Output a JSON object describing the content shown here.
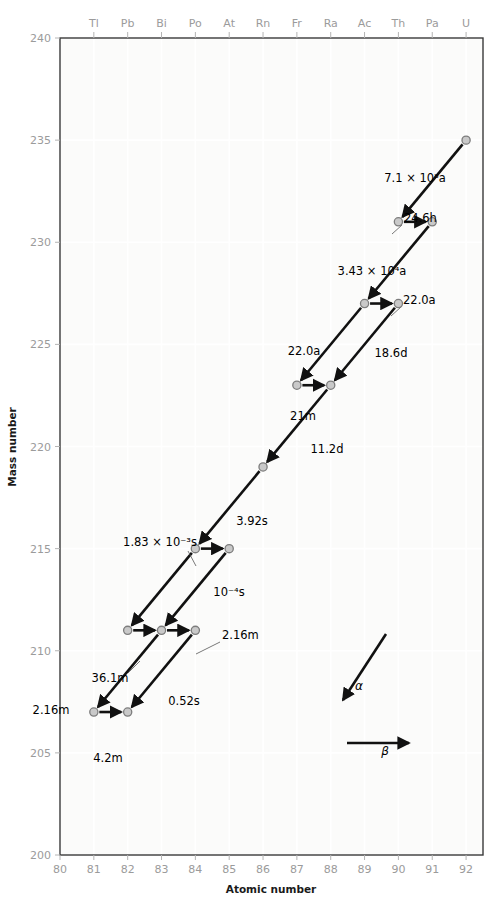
{
  "chart_data": {
    "type": "scatter",
    "title": "",
    "xlabel": "Atomic number",
    "ylabel": "Mass number",
    "xlim": [
      80,
      92.5
    ],
    "ylim": [
      200,
      240
    ],
    "grid": true,
    "legend_position": "inside-lower-right",
    "x_ticks": [
      80,
      81,
      82,
      83,
      84,
      85,
      86,
      87,
      88,
      89,
      90,
      91,
      92
    ],
    "x_tick_labels": [
      "80",
      "81",
      "82",
      "83",
      "84",
      "85",
      "86",
      "87",
      "88",
      "89",
      "90",
      "91",
      "92"
    ],
    "y_ticks": [
      200,
      205,
      210,
      215,
      220,
      225,
      230,
      235,
      240
    ],
    "y_tick_labels": [
      "200",
      "205",
      "210",
      "215",
      "220",
      "225",
      "230",
      "235",
      "240"
    ],
    "top_axis_label": "Element symbol",
    "element_symbols": [
      {
        "z": 81,
        "symbol": "Tl"
      },
      {
        "z": 82,
        "symbol": "Pb"
      },
      {
        "z": 83,
        "symbol": "Bi"
      },
      {
        "z": 84,
        "symbol": "Po"
      },
      {
        "z": 85,
        "symbol": "At"
      },
      {
        "z": 86,
        "symbol": "Rn"
      },
      {
        "z": 87,
        "symbol": "Fr"
      },
      {
        "z": 88,
        "symbol": "Ra"
      },
      {
        "z": 89,
        "symbol": "Ac"
      },
      {
        "z": 90,
        "symbol": "Th"
      },
      {
        "z": 91,
        "symbol": "Pa"
      },
      {
        "z": 92,
        "symbol": "U"
      }
    ],
    "nuclides": [
      {
        "z": 92,
        "a": 235,
        "name": "U-235"
      },
      {
        "z": 90,
        "a": 231,
        "name": "Th-231"
      },
      {
        "z": 91,
        "a": 231,
        "name": "Pa-231"
      },
      {
        "z": 89,
        "a": 227,
        "name": "Ac-227"
      },
      {
        "z": 90,
        "a": 227,
        "name": "Th-227"
      },
      {
        "z": 87,
        "a": 223,
        "name": "Fr-223"
      },
      {
        "z": 88,
        "a": 223,
        "name": "Ra-223"
      },
      {
        "z": 86,
        "a": 219,
        "name": "Rn-219"
      },
      {
        "z": 84,
        "a": 215,
        "name": "Po-215"
      },
      {
        "z": 85,
        "a": 215,
        "name": "At-215"
      },
      {
        "z": 82,
        "a": 211,
        "name": "Pb-211"
      },
      {
        "z": 83,
        "a": 211,
        "name": "Bi-211"
      },
      {
        "z": 84,
        "a": 211,
        "name": "Po-211"
      },
      {
        "z": 81,
        "a": 207,
        "name": "Tl-207"
      },
      {
        "z": 82,
        "a": 207,
        "name": "Pb-207"
      }
    ],
    "decays": [
      {
        "from": "U-235",
        "to": "Th-231",
        "from_z": 92,
        "from_a": 235,
        "to_z": 90,
        "to_a": 231,
        "type": "alpha",
        "half_life": "7.1 × 10⁸a",
        "label_x": 415,
        "label_y": 182,
        "anchor": "middle",
        "leader": false
      },
      {
        "from": "Th-231",
        "to": "Pa-231",
        "from_z": 90,
        "from_a": 231,
        "to_z": 91,
        "to_a": 231,
        "type": "beta",
        "half_life": "24.6h",
        "label_x": 404,
        "label_y": 222,
        "anchor": "start",
        "leader": true,
        "leader_x1": 402,
        "leader_y1": 225,
        "leader_x2": 392,
        "leader_y2": 234
      },
      {
        "from": "Pa-231",
        "to": "Ac-227",
        "from_z": 91,
        "from_a": 231,
        "to_z": 89,
        "to_a": 227,
        "type": "alpha",
        "half_life": "3.43 × 10⁴a",
        "label_x": 372,
        "label_y": 275,
        "anchor": "middle",
        "leader": false
      },
      {
        "from": "Ac-227",
        "to": "Th-227",
        "from_z": 89,
        "from_a": 227,
        "to_z": 90,
        "to_a": 227,
        "type": "beta",
        "half_life": "22.0a",
        "label_x": 403,
        "label_y": 304,
        "anchor": "start",
        "leader": true,
        "leader_x1": 401,
        "leader_y1": 307,
        "leader_x2": 391,
        "leader_y2": 316
      },
      {
        "from": "Ac-227",
        "to": "Fr-223",
        "from_z": 89,
        "from_a": 227,
        "to_z": 87,
        "to_a": 223,
        "type": "alpha",
        "half_life": "22.0a",
        "label_x": 304,
        "label_y": 355,
        "anchor": "middle",
        "leader": false
      },
      {
        "from": "Th-227",
        "to": "Ra-223",
        "from_z": 90,
        "from_a": 227,
        "to_z": 88,
        "to_a": 223,
        "type": "alpha",
        "half_life": "18.6d",
        "label_x": 391,
        "label_y": 357,
        "anchor": "middle",
        "leader": false
      },
      {
        "from": "Fr-223",
        "to": "Ra-223",
        "from_z": 87,
        "from_a": 223,
        "to_z": 88,
        "to_a": 223,
        "type": "beta",
        "half_life": "21m",
        "label_x": 303,
        "label_y": 420,
        "anchor": "middle",
        "leader": false
      },
      {
        "from": "Ra-223",
        "to": "Rn-219",
        "from_z": 88,
        "from_a": 223,
        "to_z": 86,
        "to_a": 219,
        "type": "alpha",
        "half_life": "11.2d",
        "label_x": 327,
        "label_y": 453,
        "anchor": "middle",
        "leader": false
      },
      {
        "from": "Rn-219",
        "to": "Po-215",
        "from_z": 86,
        "from_a": 219,
        "to_z": 84,
        "to_a": 215,
        "type": "alpha",
        "half_life": "3.92s",
        "label_x": 252,
        "label_y": 525,
        "anchor": "middle",
        "leader": false
      },
      {
        "from": "Po-215",
        "to": "At-215",
        "from_z": 84,
        "from_a": 215,
        "to_z": 85,
        "to_a": 215,
        "type": "beta",
        "half_life": "1.83 × 10⁻³s",
        "label_x": 160,
        "label_y": 546,
        "anchor": "middle",
        "leader": true,
        "leader_x1": 188,
        "leader_y1": 551,
        "leader_x2": 196,
        "leader_y2": 566
      },
      {
        "from": "At-215",
        "to": "Bi-211",
        "from_z": 85,
        "from_a": 215,
        "to_z": 83,
        "to_a": 211,
        "type": "alpha",
        "half_life": "10⁻⁴s",
        "label_x": 229,
        "label_y": 596,
        "anchor": "middle",
        "leader": false
      },
      {
        "from": "Po-215",
        "to": "Pb-211",
        "from_z": 84,
        "from_a": 215,
        "to_z": 82,
        "to_a": 211,
        "type": "alpha",
        "half_life": "",
        "label_x": 0,
        "label_y": 0,
        "anchor": "middle",
        "leader": false
      },
      {
        "from": "Pb-211",
        "to": "Bi-211",
        "from_z": 82,
        "from_a": 211,
        "to_z": 83,
        "to_a": 211,
        "type": "beta",
        "half_life": "36.1m",
        "label_x": 110,
        "label_y": 682,
        "anchor": "middle",
        "leader": true,
        "leader_x1": 128,
        "leader_y1": 673,
        "leader_x2": 140,
        "leader_y2": 661
      },
      {
        "from": "Bi-211",
        "to": "Po-211",
        "from_z": 83,
        "from_a": 211,
        "to_z": 84,
        "to_a": 211,
        "type": "beta",
        "half_life": "2.16m",
        "label_x": 222,
        "label_y": 639,
        "anchor": "start",
        "leader": true,
        "leader_x1": 220,
        "leader_y1": 642,
        "leader_x2": 196,
        "leader_y2": 654
      },
      {
        "from": "Bi-211",
        "to": "Tl-207",
        "from_z": 83,
        "from_a": 211,
        "to_z": 81,
        "to_a": 207,
        "type": "alpha",
        "half_life": "2.16m",
        "label_x": 51,
        "label_y": 714,
        "anchor": "middle",
        "leader": false
      },
      {
        "from": "Po-211",
        "to": "Pb-207",
        "from_z": 84,
        "from_a": 211,
        "to_z": 82,
        "to_a": 207,
        "type": "alpha",
        "half_life": "0.52s",
        "label_x": 184,
        "label_y": 705,
        "anchor": "middle",
        "leader": false
      },
      {
        "from": "Tl-207",
        "to": "Pb-207",
        "from_z": 81,
        "from_a": 207,
        "to_z": 82,
        "to_a": 207,
        "type": "beta",
        "half_life": "4.2m",
        "label_x": 108,
        "label_y": 762,
        "anchor": "middle",
        "leader": false
      }
    ],
    "legend": {
      "alpha_symbol": "α",
      "beta_symbol": "β",
      "alpha_label_x": 359,
      "alpha_label_y": 690,
      "beta_label_x": 385,
      "beta_label_y": 755
    }
  }
}
